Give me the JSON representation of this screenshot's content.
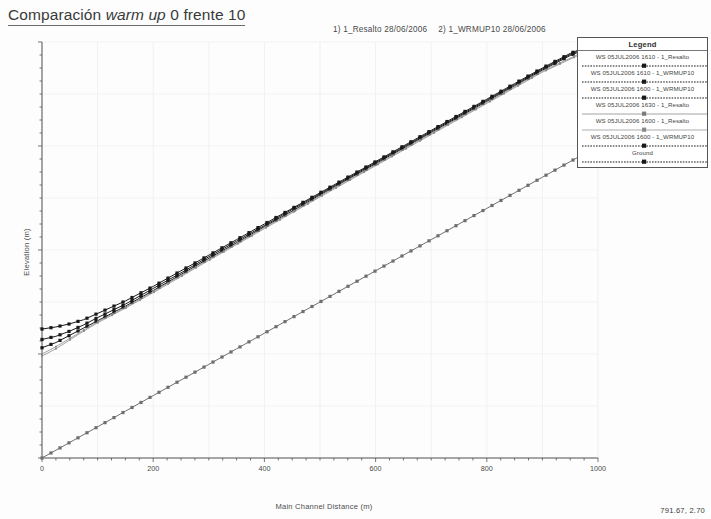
{
  "title": {
    "prefix": "Comparación ",
    "italic": "warm up",
    "suffix": " 0 frente 10"
  },
  "plot_header": {
    "run1": "1) 1_Resalto    28/06/2006",
    "run2": "2) 1_WRMUP10    28/06/2006"
  },
  "legend": {
    "title": "Legend",
    "items": [
      {
        "label": "WS  05JUL2006 1610 - 1_Resalto",
        "style": "dotted-dark",
        "color": "#1a1a1a"
      },
      {
        "label": "WS  05JUL2006 1610 - 1_WRMUP10",
        "style": "dotted-dark",
        "color": "#1a1a1a"
      },
      {
        "label": "WS  05JUL2006 1600 - 1_WRMUP10",
        "style": "dotted-dark",
        "color": "#1a1a1a"
      },
      {
        "label": "WS  05JUL2006 1630 - 1_Resalto",
        "style": "solid-light",
        "color": "#7d7d7d"
      },
      {
        "label": "WS  05JUL2006 1600 - 1_Resalto",
        "style": "solid-light",
        "color": "#8a8a8a"
      },
      {
        "label": "WS  05JUL2006 1600 - 1_WRMUP10",
        "style": "dotted-dark",
        "color": "#1a1a1a"
      },
      {
        "label": "Ground",
        "style": "dotted-dark",
        "color": "#1a1a1a"
      }
    ]
  },
  "coord_readout": "791.67, 2.70",
  "chart_data": {
    "type": "line",
    "title": "Comparación warm up 0 frente 10",
    "xlabel": "Main Channel Distance (m)",
    "ylabel": "Elevation (m)",
    "xlim": [
      0,
      1000
    ],
    "ylim": [
      0,
      8
    ],
    "xticks": [
      0,
      200,
      400,
      600,
      800,
      1000
    ],
    "yticks": [
      0,
      2,
      4,
      6,
      8
    ],
    "grid": true,
    "legend_position": "top-right-outside",
    "series": [
      {
        "name": "Ground",
        "style": "line-markers",
        "color": "#6f6f6f",
        "x": [
          0,
          50,
          100,
          150,
          200,
          250,
          300,
          350,
          400,
          450,
          500,
          550,
          600,
          650,
          700,
          750,
          800,
          850,
          900,
          950,
          1000
        ],
        "y": [
          0.0,
          0.3,
          0.6,
          0.9,
          1.2,
          1.5,
          1.8,
          2.1,
          2.4,
          2.7,
          3.0,
          3.3,
          3.6,
          3.9,
          4.2,
          4.5,
          4.8,
          5.1,
          5.4,
          5.7,
          6.0
        ]
      },
      {
        "name": "WS  05JUL2006 1610 - 1_Resalto",
        "style": "dotted-markers",
        "color": "#1a1a1a",
        "x": [
          0,
          25,
          50,
          75,
          100,
          150,
          200,
          250,
          300,
          350,
          400,
          450,
          500,
          550,
          600,
          650,
          700,
          750,
          800,
          850,
          900,
          950,
          1000
        ],
        "y": [
          2.48,
          2.52,
          2.58,
          2.66,
          2.78,
          3.02,
          3.3,
          3.6,
          3.9,
          4.2,
          4.5,
          4.8,
          5.1,
          5.4,
          5.7,
          6.0,
          6.3,
          6.6,
          6.9,
          7.2,
          7.5,
          7.78,
          8.0
        ]
      },
      {
        "name": "WS  05JUL2006 1610 - 1_WRMUP10",
        "style": "dotted-markers",
        "color": "#1a1a1a",
        "x": [
          0,
          25,
          50,
          75,
          100,
          150,
          200,
          250,
          300,
          350,
          400,
          450,
          500,
          550,
          600,
          650,
          700,
          750,
          800,
          850,
          900,
          950,
          1000
        ],
        "y": [
          2.28,
          2.34,
          2.44,
          2.56,
          2.7,
          2.96,
          3.26,
          3.56,
          3.87,
          4.17,
          4.47,
          4.78,
          5.08,
          5.38,
          5.68,
          5.98,
          6.28,
          6.58,
          6.88,
          7.18,
          7.48,
          7.76,
          7.98
        ]
      },
      {
        "name": "WS  05JUL2006 1600 - 1_WRMUP10",
        "style": "dotted-markers",
        "color": "#1a1a1a",
        "x": [
          0,
          25,
          50,
          75,
          100,
          150,
          200,
          250,
          300,
          350,
          400,
          450,
          500,
          550,
          600,
          650,
          700,
          750,
          800,
          850,
          900,
          950,
          1000
        ],
        "y": [
          2.12,
          2.22,
          2.36,
          2.5,
          2.64,
          2.92,
          3.22,
          3.53,
          3.84,
          4.14,
          4.45,
          4.75,
          5.06,
          5.36,
          5.66,
          5.96,
          6.26,
          6.56,
          6.86,
          7.16,
          7.46,
          7.74,
          7.96
        ]
      },
      {
        "name": "WS  05JUL2006 1630 - 1_Resalto",
        "style": "solid-light",
        "color": "#8a8a8a",
        "x": [
          0,
          25,
          50,
          75,
          100,
          150,
          200,
          250,
          300,
          400,
          500,
          600,
          700,
          800,
          900,
          1000
        ],
        "y": [
          2.0,
          2.14,
          2.3,
          2.46,
          2.62,
          2.9,
          3.2,
          3.51,
          3.82,
          4.43,
          5.04,
          5.64,
          6.24,
          6.84,
          7.44,
          7.94
        ]
      },
      {
        "name": "WS  05JUL2006 1600 - 1_Resalto",
        "style": "solid-light",
        "color": "#8a8a8a",
        "x": [
          0,
          25,
          50,
          75,
          100,
          150,
          200,
          250,
          300,
          400,
          500,
          600,
          700,
          800,
          900,
          1000
        ],
        "y": [
          1.96,
          2.1,
          2.27,
          2.44,
          2.6,
          2.88,
          3.18,
          3.49,
          3.8,
          4.41,
          5.02,
          5.62,
          6.22,
          6.82,
          7.42,
          7.92
        ]
      }
    ]
  }
}
